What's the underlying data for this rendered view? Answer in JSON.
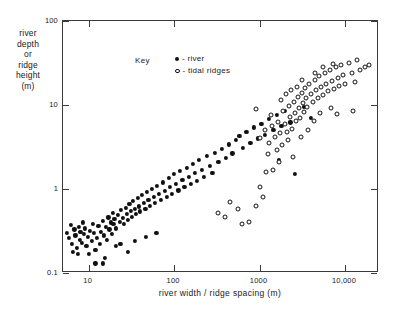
{
  "chart_data": {
    "type": "scatter",
    "title": "",
    "xlabel": "river width / ridge spacing (m)",
    "ylabel": "river depth or ridge height (m)",
    "ylabel_lines": [
      "river",
      "depth",
      "or",
      "ridge",
      "height",
      "(m)"
    ],
    "xscale": "log",
    "yscale": "log",
    "xlim": [
      5,
      25000
    ],
    "ylim": [
      0.1,
      100
    ],
    "grid": false,
    "legend_title": "Key",
    "legend_position": "top-left-inside",
    "xticks": [
      10,
      100,
      1000,
      10000
    ],
    "xticklabels": [
      "10",
      "100",
      "1000",
      "10,000"
    ],
    "yticks": [
      0.1,
      1,
      10,
      100
    ],
    "yticklabels": [
      "0.1",
      "1",
      "10",
      "100"
    ],
    "series": [
      {
        "name": "river",
        "legend_label": "- river",
        "marker": "filled-circle",
        "color": "#111111",
        "points": [
          [
            5.6,
            0.3
          ],
          [
            5.9,
            0.26
          ],
          [
            6.2,
            0.37
          ],
          [
            6.4,
            0.22
          ],
          [
            6.8,
            0.33
          ],
          [
            7.0,
            0.28
          ],
          [
            7.2,
            0.2
          ],
          [
            7.6,
            0.35
          ],
          [
            7.8,
            0.25
          ],
          [
            8.0,
            0.31
          ],
          [
            8.3,
            0.23
          ],
          [
            8.6,
            0.4
          ],
          [
            8.8,
            0.29
          ],
          [
            9.1,
            0.34
          ],
          [
            9.4,
            0.21
          ],
          [
            9.7,
            0.27
          ],
          [
            10.0,
            0.17
          ],
          [
            10.4,
            0.32
          ],
          [
            10.8,
            0.24
          ],
          [
            11.2,
            0.38
          ],
          [
            11.6,
            0.3
          ],
          [
            12.0,
            0.19
          ],
          [
            12.5,
            0.26
          ],
          [
            13.0,
            0.36
          ],
          [
            13.5,
            0.22
          ],
          [
            14.0,
            0.31
          ],
          [
            14.5,
            0.42
          ],
          [
            15.0,
            0.28
          ],
          [
            15.5,
            0.15
          ],
          [
            16.0,
            0.35
          ],
          [
            16.5,
            0.25
          ],
          [
            17.0,
            0.46
          ],
          [
            17.5,
            0.33
          ],
          [
            18.0,
            0.4
          ],
          [
            18.5,
            0.29
          ],
          [
            19.0,
            0.52
          ],
          [
            19.5,
            0.38
          ],
          [
            20.0,
            0.44
          ],
          [
            21.0,
            0.34
          ],
          [
            22.0,
            0.49
          ],
          [
            23.0,
            0.41
          ],
          [
            24.0,
            0.56
          ],
          [
            25.0,
            0.45
          ],
          [
            26.0,
            0.38
          ],
          [
            27.0,
            0.6
          ],
          [
            28.0,
            0.5
          ],
          [
            29.0,
            0.43
          ],
          [
            30.0,
            0.66
          ],
          [
            31.0,
            0.55
          ],
          [
            32.0,
            0.47
          ],
          [
            33.0,
            0.72
          ],
          [
            34.5,
            0.58
          ],
          [
            36.0,
            0.5
          ],
          [
            37.5,
            0.78
          ],
          [
            39.0,
            0.62
          ],
          [
            40.0,
            0.54
          ],
          [
            42.0,
            0.85
          ],
          [
            44.0,
            0.68
          ],
          [
            46.0,
            0.58
          ],
          [
            48.0,
            0.92
          ],
          [
            50.0,
            0.74
          ],
          [
            52.0,
            0.63
          ],
          [
            55.0,
            1.0
          ],
          [
            58.0,
            0.8
          ],
          [
            60.0,
            0.68
          ],
          [
            63.0,
            1.1
          ],
          [
            66.0,
            0.88
          ],
          [
            70.0,
            0.74
          ],
          [
            74.0,
            1.2
          ],
          [
            78.0,
            0.95
          ],
          [
            82.0,
            0.8
          ],
          [
            86.0,
            1.35
          ],
          [
            90.0,
            1.05
          ],
          [
            95.0,
            0.88
          ],
          [
            100.0,
            1.5
          ],
          [
            106.0,
            1.15
          ],
          [
            112.0,
            0.96
          ],
          [
            118.0,
            1.65
          ],
          [
            125.0,
            1.28
          ],
          [
            132.0,
            1.05
          ],
          [
            140.0,
            1.8
          ],
          [
            148.0,
            1.4
          ],
          [
            156.0,
            1.15
          ],
          [
            165.0,
            2.0
          ],
          [
            175.0,
            1.55
          ],
          [
            185.0,
            1.25
          ],
          [
            195.0,
            2.2
          ],
          [
            210.0,
            1.7
          ],
          [
            225.0,
            1.38
          ],
          [
            240.0,
            2.45
          ],
          [
            260.0,
            1.9
          ],
          [
            280.0,
            1.55
          ],
          [
            300.0,
            2.7
          ],
          [
            330.0,
            2.1
          ],
          [
            360.0,
            3.0
          ],
          [
            400.0,
            2.35
          ],
          [
            440.0,
            3.4
          ],
          [
            480.0,
            2.65
          ],
          [
            530.0,
            3.8
          ],
          [
            580.0,
            4.3
          ],
          [
            640.0,
            3.1
          ],
          [
            700.0,
            4.8
          ],
          [
            780.0,
            3.5
          ],
          [
            860.0,
            5.4
          ],
          [
            950.0,
            4.0
          ],
          [
            1050.0,
            6.0
          ],
          [
            1150.0,
            4.4
          ],
          [
            1300.0,
            6.8
          ],
          [
            1450.0,
            5.0
          ],
          [
            1600.0,
            7.6
          ],
          [
            1800.0,
            5.6
          ],
          [
            2000.0,
            8.5
          ],
          [
            2300.0,
            6.2
          ],
          [
            12.0,
            0.13
          ],
          [
            14.5,
            0.13
          ],
          [
            6.5,
            0.18
          ],
          [
            7.4,
            0.17
          ],
          [
            1700.0,
            2.2
          ],
          [
            2600.0,
            1.5
          ],
          [
            21.0,
            0.21
          ],
          [
            23.5,
            0.22
          ],
          [
            35.0,
            0.24
          ],
          [
            47.0,
            0.27
          ],
          [
            62.0,
            0.3
          ],
          [
            29.0,
            0.18
          ],
          [
            3300.0,
            9.5
          ],
          [
            4000.0,
            7.0
          ]
        ]
      },
      {
        "name": "tidal ridges",
        "legend_label": "- tidal ridges",
        "marker": "open-circle",
        "color": "#111111",
        "points": [
          [
            330.0,
            0.52
          ],
          [
            390.0,
            0.46
          ],
          [
            620.0,
            0.38
          ],
          [
            760.0,
            0.4
          ],
          [
            900.0,
            0.62
          ],
          [
            1000.0,
            1.05
          ],
          [
            1100.0,
            0.8
          ],
          [
            1200.0,
            1.6
          ],
          [
            1250.0,
            2.6
          ],
          [
            1300.0,
            3.5
          ],
          [
            1400.0,
            5.6
          ],
          [
            1500.0,
            4.2
          ],
          [
            1600.0,
            2.9
          ],
          [
            1650.0,
            6.3
          ],
          [
            1750.0,
            4.6
          ],
          [
            1850.0,
            3.3
          ],
          [
            1900.0,
            8.5
          ],
          [
            2000.0,
            6.0
          ],
          [
            2100.0,
            4.8
          ],
          [
            2200.0,
            9.6
          ],
          [
            2300.0,
            7.2
          ],
          [
            2400.0,
            5.2
          ],
          [
            2500.0,
            11.0
          ],
          [
            2600.0,
            8.0
          ],
          [
            2700.0,
            6.4
          ],
          [
            2800.0,
            12.5
          ],
          [
            2900.0,
            9.2
          ],
          [
            3000.0,
            7.0
          ],
          [
            3100.0,
            14.0
          ],
          [
            3200.0,
            10.5
          ],
          [
            3300.0,
            8.2
          ],
          [
            3400.0,
            16.0
          ],
          [
            3500.0,
            12.0
          ],
          [
            3600.0,
            9.5
          ],
          [
            3800.0,
            18.0
          ],
          [
            4000.0,
            13.5
          ],
          [
            4200.0,
            10.8
          ],
          [
            4400.0,
            20.0
          ],
          [
            4600.0,
            15.0
          ],
          [
            4800.0,
            12.0
          ],
          [
            5000.0,
            22.0
          ],
          [
            5200.0,
            16.5
          ],
          [
            5500.0,
            13.0
          ],
          [
            5800.0,
            24.0
          ],
          [
            6000.0,
            18.0
          ],
          [
            6300.0,
            14.5
          ],
          [
            6600.0,
            26.0
          ],
          [
            7000.0,
            19.5
          ],
          [
            7400.0,
            15.5
          ],
          [
            7800.0,
            28.0
          ],
          [
            8200.0,
            21.0
          ],
          [
            8600.0,
            17.0
          ],
          [
            9000.0,
            30.0
          ],
          [
            9500.0,
            22.5
          ],
          [
            10000.0,
            18.0
          ],
          [
            11000.0,
            32.0
          ],
          [
            12000.0,
            24.0
          ],
          [
            13000.0,
            19.0
          ],
          [
            14000.0,
            34.0
          ],
          [
            15000.0,
            26.0
          ],
          [
            17000.0,
            28.0
          ],
          [
            19000.0,
            30.0
          ],
          [
            1450.0,
            1.7
          ],
          [
            1700.0,
            2.1
          ],
          [
            2150.0,
            3.8
          ],
          [
            2450.0,
            2.4
          ],
          [
            3050.0,
            4.2
          ],
          [
            3700.0,
            5.0
          ],
          [
            4300.0,
            6.5
          ],
          [
            5100.0,
            8.0
          ],
          [
            1150.0,
            5.0
          ],
          [
            1350.0,
            7.5
          ],
          [
            2750.0,
            16.5
          ],
          [
            3150.0,
            20.0
          ],
          [
            900.0,
            9.0
          ],
          [
            6800.0,
            9.2
          ],
          [
            8000.0,
            7.8
          ],
          [
            12500.0,
            8.5
          ],
          [
            1000.0,
            4.0
          ],
          [
            1800.0,
            11.5
          ],
          [
            2050.0,
            13.5
          ],
          [
            2350.0,
            15.0
          ],
          [
            4500.0,
            24.0
          ],
          [
            5600.0,
            28.5
          ],
          [
            7200.0,
            31.0
          ],
          [
            450.0,
            0.7
          ],
          [
            560.0,
            0.58
          ]
        ]
      }
    ]
  },
  "axis": {
    "x_title": "river width / ridge spacing (m)",
    "y_title_lines": [
      "river",
      "depth",
      "or",
      "ridge",
      "height",
      "(m)"
    ],
    "x_tick_labels": [
      "10",
      "100",
      "1000",
      "10,000"
    ],
    "y_tick_labels": [
      "100",
      "10",
      "1",
      "0.1"
    ]
  },
  "legend": {
    "title": "Key",
    "entries": [
      {
        "marker": "filled-circle",
        "label": "- river"
      },
      {
        "marker": "open-circle",
        "label": "- tidal ridges"
      }
    ]
  },
  "colors": {
    "marker": "#111111",
    "axis": "#3a3a3a",
    "background": "#ffffff"
  }
}
